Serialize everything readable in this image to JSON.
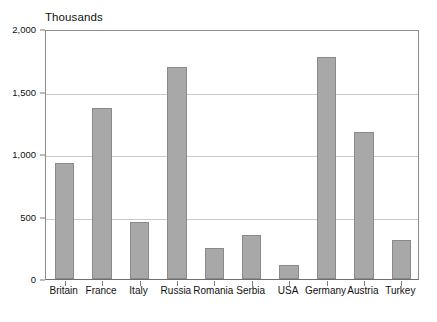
{
  "chart_data": {
    "type": "bar",
    "title": "Thousands",
    "xlabel": "",
    "ylabel": "",
    "ylim": [
      0,
      2000
    ],
    "ytick_values": [
      0,
      500,
      1000,
      1500,
      2000
    ],
    "ytick_labels": [
      "0",
      "500",
      "1,000",
      "1,500",
      "2,000"
    ],
    "grid": true,
    "legend": false,
    "categories": [
      "Britain",
      "France",
      "Italy",
      "Russia",
      "Romania",
      "Serbia",
      "USA",
      "Germany",
      "Austria",
      "Turkey"
    ],
    "values": [
      930,
      1370,
      460,
      1700,
      250,
      350,
      110,
      1780,
      1180,
      310
    ],
    "bar_color": "#a8a8a8",
    "bar_border_color": "#8a8a8a",
    "grid_color": "#c9c9c9",
    "axis_color": "#8d8d8d",
    "background_color": "#ffffff"
  }
}
